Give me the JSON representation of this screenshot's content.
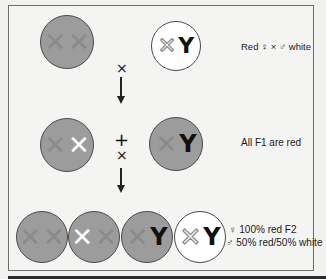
{
  "colors": {
    "red_chromosome_fill": "#9c9c9c",
    "white_chromosome_fill": "#ffffff",
    "frame_border": "#6e6e6e"
  },
  "parents": {
    "female": {
      "chromosomes": [
        "X",
        "X"
      ],
      "phenotype": "red"
    },
    "male": {
      "chromosomes": [
        "X",
        "Y"
      ],
      "phenotype": "white"
    },
    "cross_label": "Red ♀ × ♂ white",
    "cross_symbol": "×"
  },
  "f1": {
    "female": {
      "chromosomes": [
        "X",
        "X"
      ],
      "phenotype": "red"
    },
    "male": {
      "chromosomes": [
        "X",
        "Y"
      ],
      "phenotype": "red"
    },
    "plus_symbol": "+",
    "cross_symbol": "×",
    "label": "All F1 are red"
  },
  "f2": {
    "individuals": [
      {
        "chromosomes": [
          "X",
          "X"
        ],
        "phenotype": "red"
      },
      {
        "chromosomes": [
          "X",
          "X"
        ],
        "phenotype": "red"
      },
      {
        "chromosomes": [
          "X",
          "Y"
        ],
        "phenotype": "red"
      },
      {
        "chromosomes": [
          "X",
          "Y"
        ],
        "phenotype": "white"
      }
    ],
    "female_symbol": "♀",
    "female_label": "100% red F2",
    "male_symbol": "♂",
    "male_label": "50% red/50% white"
  },
  "glyphs": {
    "x": "✕",
    "y": "Y"
  }
}
